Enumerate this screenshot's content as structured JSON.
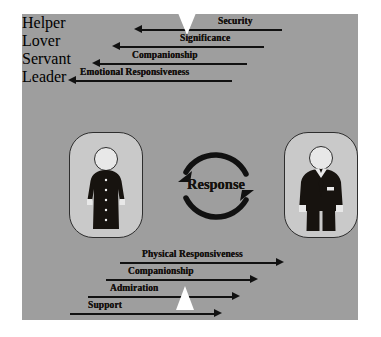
{
  "diagram": {
    "title": "Response",
    "background_color": "#9e9e9e",
    "frame_color": "#ffffff",
    "ink_color": "#111111",
    "card_color": "#c9c9c9",
    "left_role": {
      "line1": "Helper",
      "line2": "Lover",
      "figure": "woman-in-dress-icon"
    },
    "right_role": {
      "line1": "Servant",
      "line2": "Leader",
      "figure": "man-in-suit-icon"
    },
    "center": {
      "label": "Response",
      "arcs": "two-curved-arrows-circular"
    },
    "top_flows": {
      "direction": "right-to-left",
      "items": [
        {
          "label": "Security"
        },
        {
          "label": "Significance"
        },
        {
          "label": "Companionship"
        },
        {
          "label": "Emotional Responsiveness"
        }
      ]
    },
    "bottom_flows": {
      "direction": "left-to-right",
      "items": [
        {
          "label": "Physical Responsiveness"
        },
        {
          "label": "Companionship"
        },
        {
          "label": "Admiration"
        },
        {
          "label": "Support"
        }
      ]
    }
  }
}
